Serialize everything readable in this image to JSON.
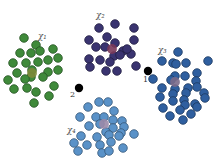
{
  "figure": {
    "background": "#ffffff"
  },
  "clusters": [
    {
      "name": "cluster-1",
      "label": "χ₁",
      "color": "#3f8a3a",
      "centroid_color": "#7d8a3a",
      "points": [
        [
          24,
          38
        ],
        [
          36,
          45
        ],
        [
          53,
          49
        ],
        [
          20,
          53
        ],
        [
          31,
          53
        ],
        [
          40,
          51
        ],
        [
          48,
          60
        ],
        [
          58,
          58
        ],
        [
          13,
          63
        ],
        [
          26,
          63
        ],
        [
          38,
          62
        ],
        [
          48,
          72
        ],
        [
          58,
          70
        ],
        [
          17,
          73
        ],
        [
          32,
          70
        ],
        [
          31,
          77
        ],
        [
          43,
          77
        ],
        [
          54,
          86
        ],
        [
          14,
          89
        ],
        [
          27,
          88
        ],
        [
          36,
          92
        ],
        [
          49,
          96
        ],
        [
          34,
          103
        ],
        [
          25,
          79
        ],
        [
          8,
          80
        ]
      ],
      "centroid": [
        32,
        73
      ]
    },
    {
      "name": "cluster-2",
      "label": "χ₂",
      "color": "#3a3470",
      "centroid_color": "#7a3a5a",
      "points": [
        [
          99,
          28
        ],
        [
          115,
          24
        ],
        [
          134,
          28
        ],
        [
          89,
          40
        ],
        [
          107,
          37
        ],
        [
          115,
          43
        ],
        [
          134,
          40
        ],
        [
          96,
          47
        ],
        [
          105,
          47
        ],
        [
          123,
          51
        ],
        [
          131,
          54
        ],
        [
          89,
          59
        ],
        [
          100,
          60
        ],
        [
          114,
          56
        ],
        [
          110,
          62
        ],
        [
          136,
          66
        ],
        [
          90,
          67
        ],
        [
          106,
          71
        ],
        [
          117,
          71
        ],
        [
          120,
          55
        ],
        [
          127,
          49
        ]
      ],
      "centroid": [
        112,
        49
      ]
    },
    {
      "name": "cluster-3",
      "label": "χ₃",
      "color": "#2f5f9f",
      "centroid_color": "#7a6a8a",
      "points": [
        [
          178,
          52
        ],
        [
          162,
          61
        ],
        [
          173,
          63
        ],
        [
          176,
          64
        ],
        [
          186,
          63
        ],
        [
          208,
          61
        ],
        [
          197,
          73
        ],
        [
          175,
          76
        ],
        [
          185,
          76
        ],
        [
          153,
          79
        ],
        [
          171,
          80
        ],
        [
          196,
          81
        ],
        [
          162,
          88
        ],
        [
          175,
          89
        ],
        [
          188,
          88
        ],
        [
          197,
          87
        ],
        [
          173,
          94
        ],
        [
          186,
          93
        ],
        [
          204,
          93
        ],
        [
          160,
          97
        ],
        [
          173,
          101
        ],
        [
          184,
          100
        ],
        [
          205,
          98
        ],
        [
          185,
          105
        ],
        [
          195,
          104
        ],
        [
          163,
          108
        ],
        [
          180,
          110
        ],
        [
          197,
          107
        ],
        [
          170,
          116
        ],
        [
          191,
          114
        ],
        [
          183,
          120
        ]
      ],
      "centroid": [
        175,
        82
      ]
    },
    {
      "name": "cluster-4",
      "label": "χ₄",
      "color": "#5a92c8",
      "centroid_color": "#9a8aa8",
      "points": [
        [
          99,
          102
        ],
        [
          108,
          102
        ],
        [
          88,
          107
        ],
        [
          114,
          111
        ],
        [
          80,
          117
        ],
        [
          96,
          117
        ],
        [
          104,
          117
        ],
        [
          113,
          120
        ],
        [
          122,
          121
        ],
        [
          89,
          126
        ],
        [
          100,
          124
        ],
        [
          113,
          128
        ],
        [
          124,
          127
        ],
        [
          106,
          132
        ],
        [
          121,
          133
        ],
        [
          81,
          136
        ],
        [
          134,
          134
        ],
        [
          97,
          137
        ],
        [
          109,
          135
        ],
        [
          119,
          136
        ],
        [
          74,
          143
        ],
        [
          87,
          145
        ],
        [
          100,
          145
        ],
        [
          111,
          142
        ],
        [
          78,
          151
        ],
        [
          102,
          153
        ],
        [
          109,
          151
        ],
        [
          123,
          148
        ]
      ],
      "centroid": [
        104,
        124
      ]
    }
  ],
  "outliers": [
    {
      "name": "outlier-1",
      "label": "1",
      "point": [
        148,
        71
      ]
    },
    {
      "name": "outlier-2",
      "label": "2",
      "point": [
        79,
        88
      ]
    }
  ]
}
